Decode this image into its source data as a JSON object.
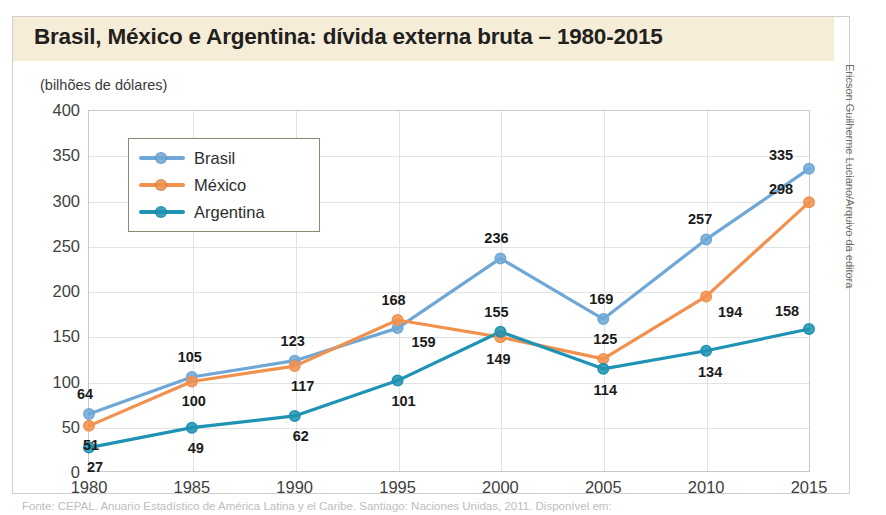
{
  "figure": {
    "title": "Brasil, México e Argentina: dívida externa bruta – 1980-2015",
    "unit_label": "(bilhões de dólares)",
    "credit": "Ericson Guilherme Luciano/Arquivo da editora",
    "source": "Fonte: CEPAL. Anuario Estadístico de América Latina y el Caribe. Santiago: Naciones Unidas, 2011. Disponível em:",
    "colors": {
      "brasil": "#6fa8d6",
      "mexico": "#f2914e",
      "argentina": "#1f93b3",
      "title_band": "#f6edd8",
      "grid": "#e2e2e2",
      "frame": "#c9c9c9",
      "label_text": "#1b1b1b"
    }
  },
  "chart_data": {
    "type": "line",
    "title": "Brasil, México e Argentina: dívida externa bruta – 1980-2015",
    "xlabel": "",
    "ylabel": "(bilhões de dólares)",
    "ylim": [
      0,
      400
    ],
    "yticks": [
      0,
      50,
      100,
      150,
      200,
      250,
      300,
      350,
      400
    ],
    "grid": true,
    "legend_position": "upper-left",
    "categories": [
      "1980",
      "1985",
      "1990",
      "1995",
      "2000",
      "2005",
      "2010",
      "2015"
    ],
    "x": [
      1980,
      1985,
      1990,
      1995,
      2000,
      2005,
      2010,
      2015
    ],
    "series": [
      {
        "name": "Brasil",
        "color": "#6fa8d6",
        "values": [
          64,
          105,
          123,
          159,
          236,
          169,
          257,
          335
        ],
        "label_offsets": [
          {
            "dx": -4,
            "dy": -20
          },
          {
            "dx": -2,
            "dy": -20
          },
          {
            "dx": -2,
            "dy": -20
          },
          {
            "dx": 26,
            "dy": 14
          },
          {
            "dx": -4,
            "dy": -20
          },
          {
            "dx": -2,
            "dy": -20
          },
          {
            "dx": -6,
            "dy": -20
          },
          {
            "dx": -28,
            "dy": -14
          }
        ]
      },
      {
        "name": "México",
        "color": "#f2914e",
        "values": [
          51,
          100,
          117,
          168,
          149,
          125,
          194,
          298
        ],
        "label_offsets": [
          {
            "dx": 2,
            "dy": 19
          },
          {
            "dx": 2,
            "dy": 19
          },
          {
            "dx": 8,
            "dy": 20
          },
          {
            "dx": -4,
            "dy": -20
          },
          {
            "dx": -2,
            "dy": 22
          },
          {
            "dx": 2,
            "dy": -20
          },
          {
            "dx": 24,
            "dy": 16
          },
          {
            "dx": -28,
            "dy": -13
          }
        ]
      },
      {
        "name": "Argentina",
        "color": "#1f93b3",
        "values": [
          27,
          49,
          62,
          101,
          155,
          114,
          134,
          158
        ],
        "label_offsets": [
          {
            "dx": 6,
            "dy": 19
          },
          {
            "dx": 4,
            "dy": 20
          },
          {
            "dx": 6,
            "dy": 20
          },
          {
            "dx": 6,
            "dy": 20
          },
          {
            "dx": -4,
            "dy": -20
          },
          {
            "dx": 2,
            "dy": 21
          },
          {
            "dx": 4,
            "dy": 21
          },
          {
            "dx": -22,
            "dy": -18
          }
        ]
      }
    ]
  },
  "legend": {
    "items": [
      {
        "label": "Brasil",
        "color": "#6fa8d6"
      },
      {
        "label": "México",
        "color": "#f2914e"
      },
      {
        "label": "Argentina",
        "color": "#1f93b3"
      }
    ]
  }
}
